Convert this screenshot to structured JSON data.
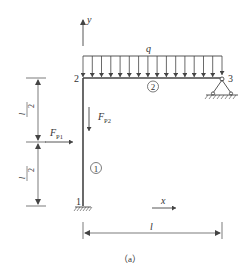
{
  "figure": {
    "caption": "（a）",
    "colors": {
      "line": "#444444",
      "text": "#333333",
      "background": "#ffffff"
    }
  },
  "axes": {
    "y_label": "y",
    "x_label": "x"
  },
  "nodes": [
    {
      "id": "1",
      "label": "1",
      "support": "fixed"
    },
    {
      "id": "2",
      "label": "2",
      "support": "rigid-joint"
    },
    {
      "id": "3",
      "label": "3",
      "support": "pinned"
    }
  ],
  "members": [
    {
      "id": "1",
      "label": "1",
      "from": "1",
      "to": "2",
      "orientation": "vertical"
    },
    {
      "id": "2",
      "label": "2",
      "from": "2",
      "to": "3",
      "orientation": "horizontal"
    }
  ],
  "loads": {
    "distributed": {
      "label": "q",
      "arrow_count": 16
    },
    "fp1": {
      "label_main": "F",
      "label_sub": "P1",
      "direction": "right"
    },
    "fp2": {
      "label_main": "F",
      "label_sub": "P2",
      "direction": "down"
    }
  },
  "dimensions": {
    "upper_half": {
      "numerator": "l",
      "denominator": "2"
    },
    "lower_half": {
      "numerator": "l",
      "denominator": "2"
    },
    "span": {
      "label": "l"
    }
  }
}
